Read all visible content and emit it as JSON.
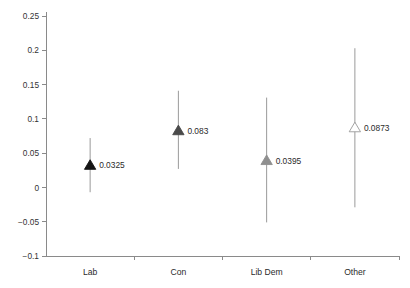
{
  "chart_data": {
    "type": "scatter",
    "title": "",
    "xlabel": "",
    "ylabel": "",
    "categories": [
      "Lab",
      "Con",
      "Lib Dem",
      "Other"
    ],
    "values": [
      0.0325,
      0.083,
      0.0395,
      0.0873
    ],
    "value_labels": [
      "0.0325",
      "0.083",
      "0.0395",
      "0.0873"
    ],
    "error_low": [
      -0.007,
      0.027,
      -0.051,
      -0.029
    ],
    "error_high": [
      0.072,
      0.141,
      0.131,
      0.203
    ],
    "marker_fills": [
      "#151515",
      "#4a4a4a",
      "#8f8f8f",
      "#ffffff"
    ],
    "marker_strokes": [
      "#151515",
      "#4a4a4a",
      "#8f8f8f",
      "#9a9a9a"
    ],
    "marker_shape": "triangle-up",
    "ylim": [
      -0.1,
      0.25
    ],
    "yticks": [
      -0.1,
      -0.05,
      0,
      0.05,
      0.1,
      0.15,
      0.2,
      0.25
    ],
    "ytick_labels": [
      "−0.1",
      "−0.05",
      "0",
      "0.05",
      "0.1",
      "0.15",
      "0.2",
      "0.25"
    ],
    "grid": false,
    "legend": "none",
    "errorbar_color": "#9a9a9a",
    "axis_color": "#8a8a8a"
  }
}
